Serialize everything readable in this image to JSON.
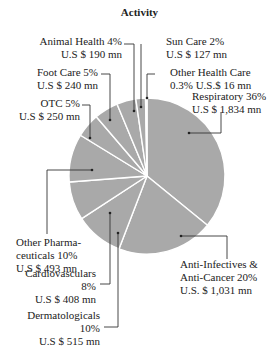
{
  "chart_data": {
    "type": "pie",
    "title": "Activity",
    "start_angle": "12 o'clock, clockwise",
    "colors": {
      "slice": "#a9a9a9",
      "separator": "#ffffff",
      "leader": "#333333"
    },
    "slices": [
      {
        "name": "Respiratory",
        "percent": 36,
        "value_label": "U.S $ 1,834 mn",
        "value": 1834
      },
      {
        "name": "Anti-Infectives & Anti-Cancer",
        "percent": 20,
        "value_label": "U.S. $ 1,031 mn",
        "value": 1031
      },
      {
        "name": "Dermatologicals",
        "percent": 10,
        "value_label": "U.S $ 515 mn",
        "value": 515
      },
      {
        "name": "Cardiovasculars",
        "percent": 8,
        "value_label": "U.S $ 408 mn",
        "value": 408
      },
      {
        "name": "Other Pharmaceuticals",
        "percent": 10,
        "value_label": "U.S $ 493 mn",
        "value": 493
      },
      {
        "name": "OTC",
        "percent": 5,
        "value_label": "U.S $ 250 mn",
        "value": 250
      },
      {
        "name": "Foot Care",
        "percent": 5,
        "value_label": "U.S $ 240 mn",
        "value": 240
      },
      {
        "name": "Animal Health",
        "percent": 4,
        "value_label": "U.S $ 190 mn",
        "value": 190
      },
      {
        "name": "Sun Care",
        "percent": 2,
        "value_label": "U.S $ 127 mn",
        "value": 127
      },
      {
        "name": "Other Health Care",
        "percent": 0.3,
        "value_label": "U.S.$ 16 mn",
        "value": 16
      }
    ]
  },
  "labels": {
    "respiratory": {
      "line1": "Respiratory 36%",
      "line2": "U.S $ 1,834 mn"
    },
    "anti": {
      "line1": "Anti-Infectives &",
      "line2": "Anti-Cancer  20%",
      "line3": "U.S. $ 1,031 mn"
    },
    "derm": {
      "line1": "Dermatologicals",
      "line2": "10%",
      "line3": "U.S $ 515 mn"
    },
    "cardio": {
      "line1": "Cardiovasculars",
      "line2": "8%",
      "line3": "U.S $ 408 mn"
    },
    "otherpharma": {
      "line1": "Other Pharma-",
      "line2": "ceuticals  10%",
      "line3": "U.S $ 493 mn"
    },
    "otc": {
      "line1": "OTC  5%",
      "line2": "U.S $ 250 mn"
    },
    "foot": {
      "line1": "Foot Care  5%",
      "line2": "U.S $ 240 mn"
    },
    "animal": {
      "line1": "Animal Health  4%",
      "line2": "U.S $ 190 mn"
    },
    "sun": {
      "line1": "Sun Care  2%",
      "line2": "U.S $ 127 mn"
    },
    "ohc": {
      "line1": "Other Health Care",
      "line2": "0.3%    U.S.$ 16 mn"
    }
  }
}
